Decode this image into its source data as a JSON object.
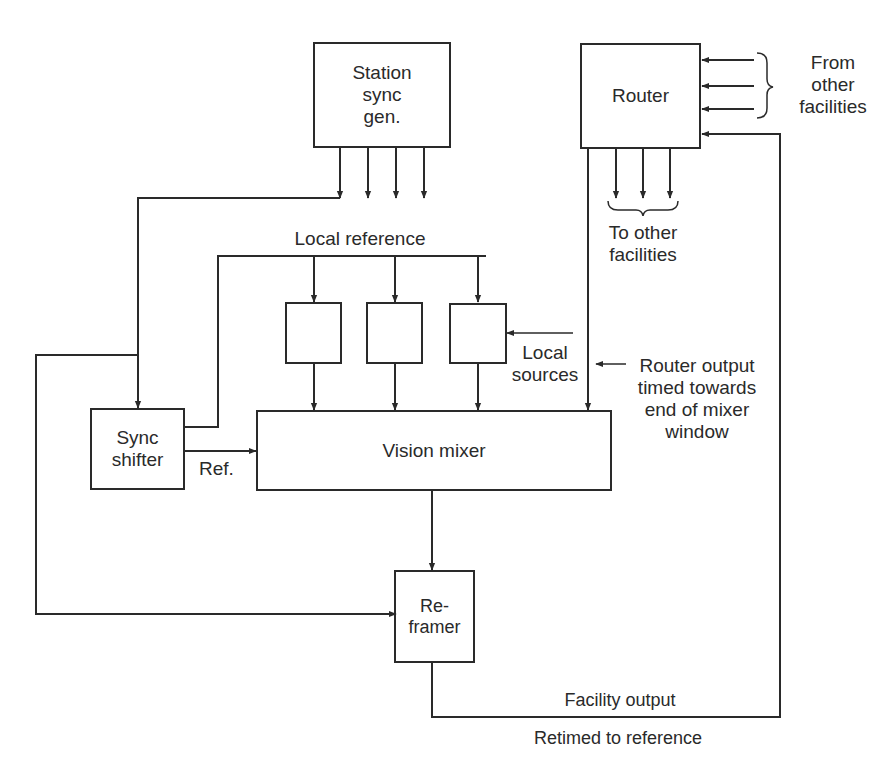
{
  "diagram": {
    "line_color": "#2a2a2a",
    "background": "#ffffff"
  },
  "blocks": {
    "station_sync_gen": "Station\nsync\ngen.",
    "router": "Router",
    "sync_shifter": "Sync\nshifter",
    "vision_mixer": "Vision mixer",
    "reframer": "Re-\nframer",
    "local_source_1": "",
    "local_source_2": "",
    "local_source_3": ""
  },
  "labels": {
    "from_other_facilities": "From\nother\nfacilities",
    "to_other_facilities": "To other\nfacilities",
    "local_reference": "Local reference",
    "local_sources": "Local\nsources",
    "router_output_note": "Router output\ntimed towards\nend of mixer\nwindow",
    "ref": "Ref.",
    "facility_output": "Facility output",
    "retimed_to_reference": "Retimed to reference"
  }
}
